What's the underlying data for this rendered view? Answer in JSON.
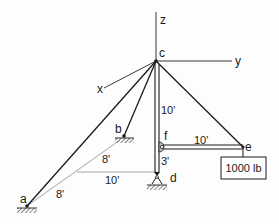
{
  "diagram": {
    "type": "3D mast / boom structure with guy cables",
    "axes": {
      "x": "x",
      "y": "y",
      "z": "z"
    },
    "points": {
      "a": "a",
      "b": "b",
      "c": "c",
      "d": "d",
      "e": "e",
      "f": "f"
    },
    "dimensions": {
      "cf": "10'",
      "fd": "3'",
      "fe": "10'",
      "ground_to_d": "10'",
      "ground_to_b": "8'",
      "ground_to_a": "8'"
    },
    "load": {
      "label": "1000 lb"
    },
    "colors": {
      "line": "#1a1a1a",
      "thin_line": "#9a9a9a",
      "background": "#fdfdfd"
    }
  }
}
